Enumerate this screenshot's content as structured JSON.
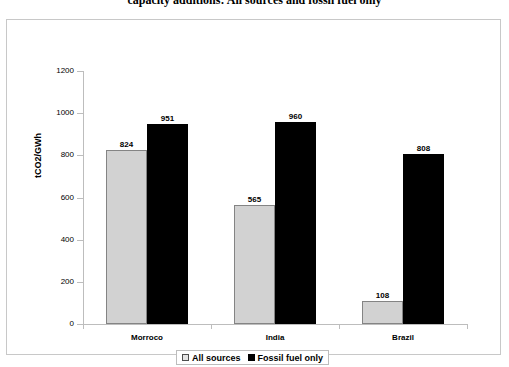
{
  "chart_data": {
    "type": "bar",
    "title": "capacity additions: All sources and fossil fuel only",
    "xlabel": "",
    "ylabel": "tCO2/GWh",
    "ylim": [
      0,
      1200
    ],
    "yticks": [
      0,
      200,
      400,
      600,
      800,
      1000,
      1200
    ],
    "ytick_labels": [
      "0",
      "200",
      "400",
      "600",
      "800",
      "1000",
      "1200"
    ],
    "grid": false,
    "legend_position": "bottom",
    "categories": [
      "Morroco",
      "India",
      "Brazil"
    ],
    "series": [
      {
        "name": "All sources",
        "color": "#d2d2d2",
        "values": [
          824,
          565,
          108
        ],
        "value_labels": [
          "824",
          "565",
          "108"
        ]
      },
      {
        "name": "Fossil fuel only",
        "color": "#000000",
        "values": [
          951,
          960,
          808
        ],
        "value_labels": [
          "951",
          "960",
          "808"
        ]
      }
    ]
  },
  "legend": {
    "items": [
      {
        "label": "All sources",
        "swatch": "all-sources"
      },
      {
        "label": "Fossil fuel only",
        "swatch": "fossil"
      }
    ]
  },
  "colors": {
    "all_sources": "#d2d2d2",
    "fossil_fuel": "#000000",
    "axis": "#bdbdbd",
    "frame": "#c8c8c8",
    "text": "#000000"
  }
}
